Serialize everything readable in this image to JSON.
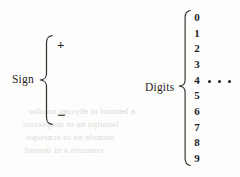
{
  "figure": {
    "background_color": "#fdfdfc",
    "ink_color": "#231f20"
  },
  "sign_group": {
    "label": "Sign",
    "brace_orientation": "left-pointing-curly-brace",
    "members": [
      "+",
      "−"
    ]
  },
  "digits_group": {
    "label": "Digits",
    "brace_orientation": "left-pointing-curly-brace",
    "members": [
      "0",
      "1",
      "2",
      "3",
      "4",
      "5",
      "6",
      "7",
      "8",
      "9"
    ],
    "ellipsis": "•••",
    "ellipsis_dot_count": 3
  },
  "scan_bleed_through": {
    "visible": true,
    "note": "faint mirrored text showing through from the reverse page",
    "lines": [
      "a lemtzol ot ebycam nmuloc",
      "lanoitpo na ot dnopserroc",
      "tnemele na ro ecneuqes",
      "erutcurts a ni demrof"
    ]
  }
}
